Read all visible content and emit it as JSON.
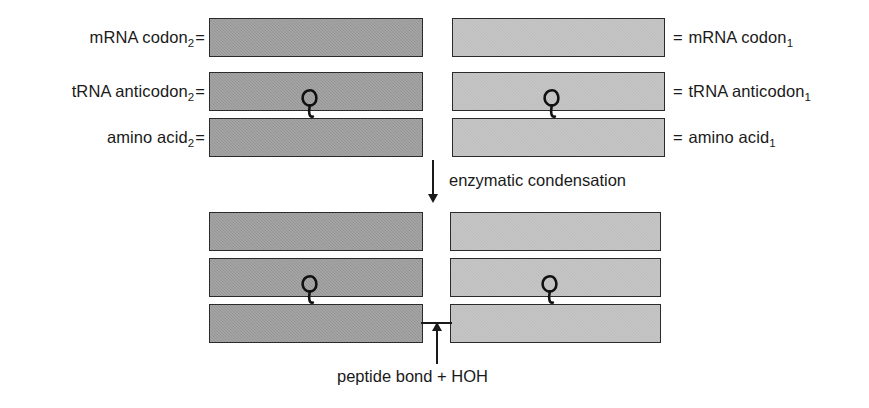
{
  "diagram": {
    "colors": {
      "bar_dark": "#9a9a9a",
      "bar_light": "#c4c4c4",
      "bar_border": "#2b2b2b",
      "text": "#1a1a1a",
      "background": "#ffffff"
    }
  },
  "top_stage": {
    "left_labels": [
      {
        "text": "mRNA codon",
        "sub": "2",
        "equals": "="
      },
      {
        "text": "tRNA anticodon",
        "sub": "2",
        "equals": "="
      },
      {
        "text": "amino acid",
        "sub": "2",
        "equals": "="
      }
    ],
    "right_labels": [
      {
        "equals": "=",
        "text": "mRNA codon",
        "sub": "1"
      },
      {
        "equals": "=",
        "text": "tRNA anticodon",
        "sub": "1"
      },
      {
        "equals": "=",
        "text": "amino acid",
        "sub": "1"
      }
    ],
    "left_bars": [
      {
        "role": "mrna-codon-2",
        "shade": "dark"
      },
      {
        "role": "trna-anticodon-2",
        "shade": "dark"
      },
      {
        "role": "amino-acid-2",
        "shade": "dark"
      }
    ],
    "right_bars": [
      {
        "role": "mrna-codon-1",
        "shade": "light"
      },
      {
        "role": "trna-anticodon-1",
        "shade": "light"
      },
      {
        "role": "amino-acid-1",
        "shade": "light"
      }
    ]
  },
  "transition": {
    "arrow_direction": "down",
    "caption": "enzymatic condensation"
  },
  "bottom_stage": {
    "left_bars": [
      {
        "role": "mrna-codon-2",
        "shade": "dark"
      },
      {
        "role": "trna-anticodon-2",
        "shade": "dark"
      },
      {
        "role": "amino-acid-2",
        "shade": "dark"
      }
    ],
    "right_bars": [
      {
        "role": "mrna-codon-1",
        "shade": "light"
      },
      {
        "role": "trna-anticodon-1",
        "shade": "light"
      },
      {
        "role": "amino-acid-1",
        "shade": "light"
      }
    ],
    "bond_arrow_direction": "up",
    "caption": "peptide bond + HOH"
  }
}
